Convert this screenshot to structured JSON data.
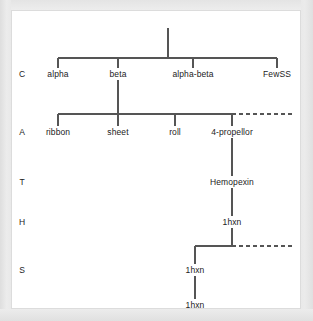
{
  "diagram": {
    "line_color": "#555555",
    "text_color": "#222222",
    "background_color": "#ffffff",
    "page_background_color": "#e9e9e9",
    "row_labels": [
      {
        "id": "C",
        "text": "C",
        "x": 22,
        "y": 74
      },
      {
        "id": "A",
        "text": "A",
        "x": 22,
        "y": 132
      },
      {
        "id": "T",
        "text": "T",
        "x": 22,
        "y": 182
      },
      {
        "id": "H",
        "text": "H",
        "x": 22,
        "y": 222
      },
      {
        "id": "S",
        "text": "S",
        "x": 22,
        "y": 270
      }
    ],
    "nodes": [
      {
        "id": "alpha",
        "text": "alpha",
        "row": "C",
        "x": 58,
        "y": 74
      },
      {
        "id": "beta",
        "text": "beta",
        "row": "C",
        "x": 118,
        "y": 74
      },
      {
        "id": "alpha-beta",
        "text": "alpha-beta",
        "row": "C",
        "x": 193,
        "y": 74
      },
      {
        "id": "fewss",
        "text": "FewSS",
        "row": "C",
        "x": 277,
        "y": 74
      },
      {
        "id": "ribbon",
        "text": "ribbon",
        "row": "A",
        "x": 58,
        "y": 132
      },
      {
        "id": "sheet",
        "text": "sheet",
        "row": "A",
        "x": 118,
        "y": 132
      },
      {
        "id": "roll",
        "text": "roll",
        "row": "A",
        "x": 175,
        "y": 132
      },
      {
        "id": "4-propellor",
        "text": "4-propellor",
        "row": "A",
        "x": 232,
        "y": 132
      },
      {
        "id": "hemopexin",
        "text": "Hemopexin",
        "row": "T",
        "x": 232,
        "y": 182
      },
      {
        "id": "1hxn-h",
        "text": "1hxn",
        "row": "H",
        "x": 232,
        "y": 222
      },
      {
        "id": "1hxn-s1",
        "text": "1hxn",
        "row": "S",
        "x": 195,
        "y": 270
      },
      {
        "id": "1hxn-s2",
        "text": "1hxn",
        "row": "S",
        "x": 195,
        "y": 305
      }
    ],
    "edges": {
      "root_stem": {
        "style": "solid",
        "x": 168,
        "y1": 28,
        "y2": 58
      },
      "c_connector": {
        "style": "solid",
        "y": 58,
        "x1": 58,
        "x2": 277
      },
      "c_drops": {
        "style": "solid",
        "y1": 58,
        "y2": 68,
        "x": [
          58,
          118,
          193,
          277
        ]
      },
      "beta_stem": {
        "style": "solid",
        "x": 118,
        "y1": 80,
        "y2": 114
      },
      "a_connector": {
        "style": "solid",
        "y": 114,
        "x1": 58,
        "x2": 232
      },
      "a_connector_ext": {
        "style": "dashed",
        "y": 114,
        "x1": 232,
        "x2": 293
      },
      "a_drops": {
        "style": "solid",
        "y1": 114,
        "y2": 126,
        "x": [
          58,
          118,
          175,
          232
        ]
      },
      "t_stem": {
        "style": "solid",
        "x": 232,
        "y1": 138,
        "y2": 176
      },
      "h_stem": {
        "style": "solid",
        "x": 232,
        "y1": 188,
        "y2": 216
      },
      "s_stem": {
        "style": "solid",
        "x": 232,
        "y1": 228,
        "y2": 246
      },
      "s_connector": {
        "style": "solid",
        "y": 246,
        "x1": 195,
        "x2": 232
      },
      "s_connector_ext": {
        "style": "dashed",
        "y": 246,
        "x1": 232,
        "x2": 293
      },
      "s_drop": {
        "style": "solid",
        "x": 195,
        "y1": 246,
        "y2": 264
      },
      "s_leaf_stem": {
        "style": "solid",
        "x": 195,
        "y1": 276,
        "y2": 299
      }
    }
  }
}
